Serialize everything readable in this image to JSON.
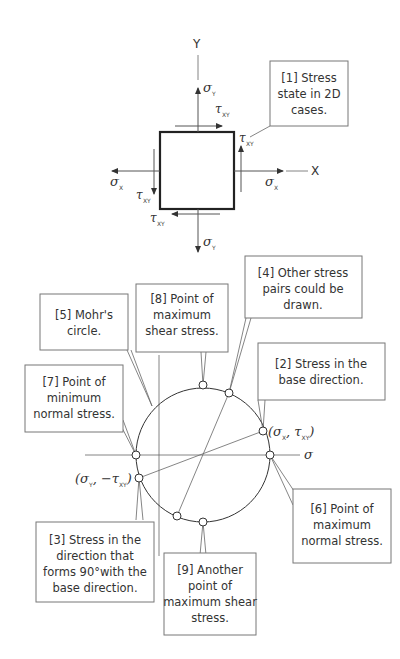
{
  "element_figure": {
    "axis_y_label": "Y",
    "axis_x_label": "X",
    "sigma": "σ",
    "tau": "τ",
    "sub_x": "X",
    "sub_y": "Y",
    "sub_xy": "XY"
  },
  "mohr_figure": {
    "axis_sigma_label": "σ",
    "axis_tau_label": "τ",
    "point_base_label": {
      "open": "(σ",
      "sub1": "X",
      "mid": ", τ",
      "sub2": "XY",
      "close": ")"
    },
    "point_perp_label": {
      "open": "(σ",
      "sub1": "Y",
      "mid": ", −τ",
      "sub2": "XY",
      "close": ")"
    }
  },
  "callouts": [
    {
      "id": "1",
      "lines": [
        "[1] Stress",
        "state in 2D",
        "cases."
      ]
    },
    {
      "id": "2",
      "lines": [
        "[2] Stress in the",
        "base direction."
      ]
    },
    {
      "id": "3",
      "lines": [
        "[3] Stress in the",
        "direction that",
        "forms 90°with the",
        "base direction."
      ]
    },
    {
      "id": "4",
      "lines": [
        "[4] Other stress",
        "pairs could be",
        "drawn."
      ]
    },
    {
      "id": "5",
      "lines": [
        "[5] Mohr's",
        "circle."
      ]
    },
    {
      "id": "6",
      "lines": [
        "[6] Point of",
        "maximum",
        "normal stress."
      ]
    },
    {
      "id": "7",
      "lines": [
        "[7] Point of",
        "minimum",
        "normal stress."
      ]
    },
    {
      "id": "8",
      "lines": [
        "[8] Point of",
        "maximum",
        "shear stress."
      ]
    },
    {
      "id": "9",
      "lines": [
        "[9] Another",
        "point of",
        "maximum shear",
        "stress."
      ]
    }
  ]
}
